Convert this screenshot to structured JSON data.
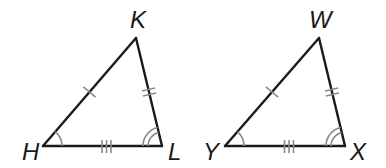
{
  "figure": {
    "colors": {
      "side_stroke": "#1a1a1a",
      "mark_stroke": "#8a8a8a",
      "label": "#1a1a1a",
      "background": "#ffffff"
    }
  },
  "triangles": [
    {
      "name": "HKL",
      "vertices": {
        "H": {
          "label": "H",
          "x": 43,
          "y": 146
        },
        "K": {
          "label": "K",
          "x": 136,
          "y": 38
        },
        "L": {
          "label": "L",
          "x": 162,
          "y": 146
        }
      },
      "side_marks": [
        {
          "side": "HK",
          "ticks": 1
        },
        {
          "side": "KL",
          "ticks": 2
        },
        {
          "side": "HL",
          "ticks": 3
        }
      ],
      "angle_marks": [
        {
          "vertex": "H",
          "arcs": 1
        },
        {
          "vertex": "L",
          "arcs": 2
        }
      ]
    },
    {
      "name": "YWX",
      "vertices": {
        "Y": {
          "label": "Y",
          "x": 225,
          "y": 146
        },
        "W": {
          "label": "W",
          "x": 319,
          "y": 38
        },
        "X": {
          "label": "X",
          "x": 345,
          "y": 146
        }
      },
      "side_marks": [
        {
          "side": "YW",
          "ticks": 1
        },
        {
          "side": "WX",
          "ticks": 2
        },
        {
          "side": "YX",
          "ticks": 3
        }
      ],
      "angle_marks": [
        {
          "vertex": "Y",
          "arcs": 1
        },
        {
          "vertex": "X",
          "arcs": 2
        }
      ]
    }
  ],
  "labels": {
    "H": "H",
    "K": "K",
    "L": "L",
    "W": "W",
    "Y": "Y",
    "X": "X"
  }
}
